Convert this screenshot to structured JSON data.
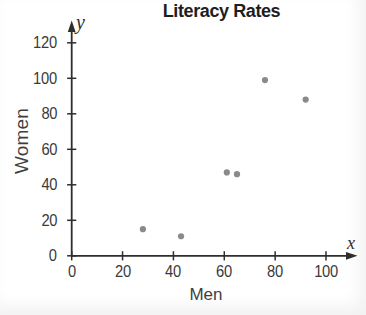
{
  "chart_data": {
    "type": "scatter",
    "title": "Literacy Rates",
    "xlabel": "Men",
    "ylabel": "Women",
    "x_axis_letter": "x",
    "y_axis_letter": "y",
    "x_ticks": [
      0,
      20,
      40,
      60,
      80,
      100
    ],
    "y_ticks": [
      0,
      20,
      40,
      60,
      80,
      100,
      120
    ],
    "xlim": [
      0,
      112
    ],
    "ylim": [
      0,
      132
    ],
    "grid": false,
    "legend": false,
    "points": [
      {
        "x": 28,
        "y": 15
      },
      {
        "x": 43,
        "y": 11
      },
      {
        "x": 61,
        "y": 47
      },
      {
        "x": 65,
        "y": 46
      },
      {
        "x": 76,
        "y": 99
      },
      {
        "x": 92,
        "y": 88
      }
    ],
    "colors": {
      "point": "#8a8a8a",
      "axis": "#2e2e2e",
      "tick_label": "#3a3a3a",
      "title": "#1e1e1e",
      "background": "#ffffff"
    }
  }
}
